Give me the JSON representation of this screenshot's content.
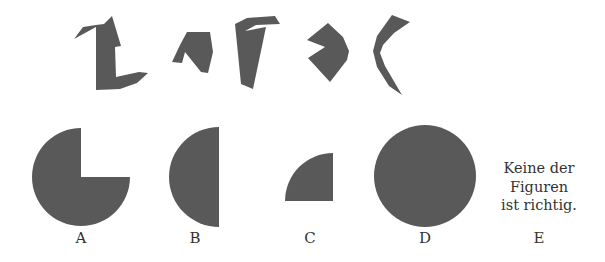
{
  "puzzle": {
    "fill_color": "#595959",
    "pieces": [
      {
        "id": "piece-1",
        "points": "74,39 83,27 96,25 104,24 112,16 121,46 115,47 116,77 139,72 148,73 137,83 120,89 96,90 96,27"
      },
      {
        "id": "piece-2",
        "points": "187,32 210,32 213,52 208,73 201,72 185,52 182,63 172,62 180,45"
      },
      {
        "id": "piece-3",
        "points": "235,24 247,18 275,16 280,24 256,25 245,31 266,27 253,89 241,84"
      },
      {
        "id": "piece-4",
        "points": "307,40 328,23 343,37 349,51 347,60 330,82 308,58 325,47"
      },
      {
        "id": "piece-5",
        "points": "392,15 410,22 394,33 383,45 380,53 385,66 402,95 389,86 377,67 373,51 377,36"
      }
    ],
    "options": [
      {
        "letter": "A",
        "shape": "three-quarter-circle",
        "cx": 81,
        "cy": 177,
        "r": 49,
        "label_x": 81
      },
      {
        "letter": "B",
        "shape": "half-circle",
        "cx": 219,
        "cy": 177,
        "r": 50,
        "label_x": 195
      },
      {
        "letter": "C",
        "shape": "quarter-circle",
        "cx": 333,
        "cy": 201,
        "r": 48,
        "label_x": 310
      },
      {
        "letter": "D",
        "shape": "full-circle",
        "cx": 425,
        "cy": 176,
        "r": 51,
        "label_x": 425
      },
      {
        "letter": "E",
        "shape": "text",
        "label_x": 539
      }
    ],
    "option_e_text": [
      "Keine der",
      "Figuren",
      "ist richtig."
    ]
  }
}
